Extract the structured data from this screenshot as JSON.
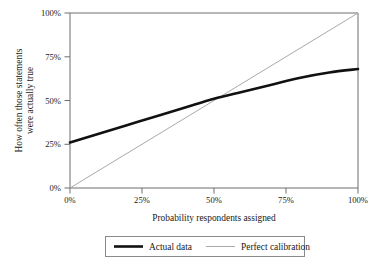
{
  "chart_data": {
    "type": "line",
    "title": "",
    "xlabel": "Probability respondents assigned",
    "ylabel": "How often those statements were actually true",
    "ylabel_line1": "How often those statements",
    "ylabel_line2": "were actually true",
    "xlim": [
      0,
      100
    ],
    "ylim": [
      0,
      100
    ],
    "grid": false,
    "legend_position": "bottom",
    "x_tick_labels": [
      "0%",
      "25%",
      "50%",
      "75%",
      "100%"
    ],
    "x_tick_values": [
      0,
      25,
      50,
      75,
      100
    ],
    "y_tick_labels": [
      "0%",
      "25%",
      "50%",
      "75%",
      "100%"
    ],
    "y_tick_values": [
      0,
      25,
      50,
      75,
      100
    ],
    "series": [
      {
        "name": "Actual data",
        "color": "#111111",
        "width": 2.6,
        "x": [
          0,
          10,
          20,
          30,
          40,
          50,
          60,
          70,
          80,
          90,
          100
        ],
        "values": [
          26,
          31,
          36,
          41,
          46,
          51,
          55,
          59,
          63,
          66,
          68
        ]
      },
      {
        "name": "Perfect calibration",
        "color": "#a9a9a9",
        "width": 1,
        "x": [
          0,
          100
        ],
        "values": [
          0,
          100
        ]
      }
    ],
    "annotations": {
      "crossing_point_x": 52,
      "crossing_point_y": 52
    }
  },
  "legend": {
    "entries": [
      {
        "label": "Actual data",
        "color": "#111111"
      },
      {
        "label": "Perfect calibration",
        "color": "#a9a9a9"
      }
    ]
  },
  "colors": {
    "background": "#ffffff",
    "axis": "#6e6e6e",
    "actual_data": "#111111",
    "perfect_calibration": "#a9a9a9",
    "text": "#1a1a1a"
  }
}
